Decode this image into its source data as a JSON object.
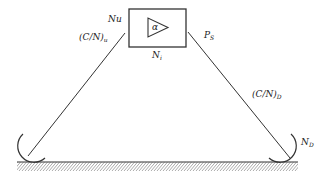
{
  "diagram": {
    "type": "satellite-link",
    "transponder": {
      "symbol": "α",
      "label_input_noise": "Nu",
      "label_internal_noise": "N",
      "label_internal_noise_sub": "i",
      "label_power": "P",
      "label_power_sub": "S"
    },
    "uplink": {
      "label": "(C/N)",
      "label_sub": "u"
    },
    "downlink": {
      "label": "(C/N)",
      "label_sub": "D"
    },
    "receiver": {
      "label": "N",
      "label_sub": "D"
    },
    "colors": {
      "stroke": "#333333",
      "hatch": "#555555"
    }
  }
}
